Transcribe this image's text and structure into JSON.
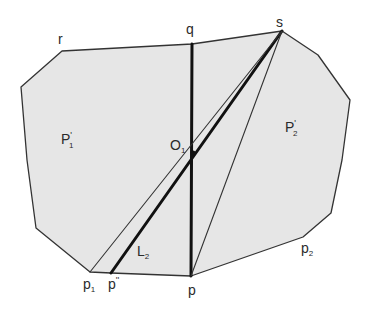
{
  "figure": {
    "width": 367,
    "height": 309,
    "background": "#ffffff",
    "region_fill": "#e6e6e6",
    "edge_color": "#333333",
    "thick_color": "#111111"
  },
  "polygon": {
    "vertices": [
      {
        "name": "r",
        "x": 62,
        "y": 51
      },
      {
        "name": "q-top",
        "x": 192,
        "y": 44
      },
      {
        "name": "s",
        "x": 282,
        "y": 31
      },
      {
        "name": "v-right-1",
        "x": 318,
        "y": 55
      },
      {
        "name": "v-right-2",
        "x": 350,
        "y": 100
      },
      {
        "name": "v-right-3",
        "x": 342,
        "y": 160
      },
      {
        "name": "v-right-4",
        "x": 331,
        "y": 213
      },
      {
        "name": "p2",
        "x": 303,
        "y": 237
      },
      {
        "name": "p",
        "x": 191,
        "y": 276
      },
      {
        "name": "p''",
        "x": 111,
        "y": 273
      },
      {
        "name": "p1",
        "x": 90,
        "y": 272
      },
      {
        "name": "v-left-1",
        "x": 36,
        "y": 228
      },
      {
        "name": "v-left-2",
        "x": 27,
        "y": 160
      },
      {
        "name": "v-left-3",
        "x": 21,
        "y": 87
      }
    ]
  },
  "segments": [
    {
      "name": "segment-q-p",
      "from": [
        192,
        44
      ],
      "to": [
        191,
        276
      ],
      "weight": "thick"
    },
    {
      "name": "segment-s-p-double-prime-L2",
      "from": [
        282,
        31
      ],
      "to": [
        111,
        273
      ],
      "weight": "thick"
    },
    {
      "name": "segment-s-p1",
      "from": [
        282,
        31
      ],
      "to": [
        90,
        272
      ],
      "weight": "thin"
    },
    {
      "name": "segment-s-p",
      "from": [
        282,
        31
      ],
      "to": [
        191,
        276
      ],
      "weight": "thin"
    }
  ],
  "points": [
    {
      "name": "O1",
      "x": 193,
      "y": 153
    }
  ],
  "labels": {
    "r": {
      "text": "r",
      "x": 58,
      "y": 44
    },
    "q": {
      "text": "q",
      "x": 186,
      "y": 34
    },
    "s": {
      "text": "s",
      "x": 276,
      "y": 27
    },
    "O1": {
      "text": "O",
      "sub": "1",
      "x": 170,
      "y": 150
    },
    "P1prime": {
      "text": "P",
      "sup": "'",
      "sub": "1",
      "x": 61,
      "y": 144
    },
    "P2prime": {
      "text": "P",
      "sup": "'",
      "sub": "2",
      "x": 285,
      "y": 132
    },
    "L2": {
      "text": "L",
      "sub": "2",
      "x": 137,
      "y": 256
    },
    "p1": {
      "text": "p",
      "sub": "1",
      "x": 83,
      "y": 289
    },
    "p_double_prime": {
      "text": "p",
      "sup": "''",
      "x": 108,
      "y": 289
    },
    "p": {
      "text": "p",
      "x": 188,
      "y": 295
    },
    "p2": {
      "text": "p",
      "sub": "2",
      "x": 301,
      "y": 253
    }
  }
}
